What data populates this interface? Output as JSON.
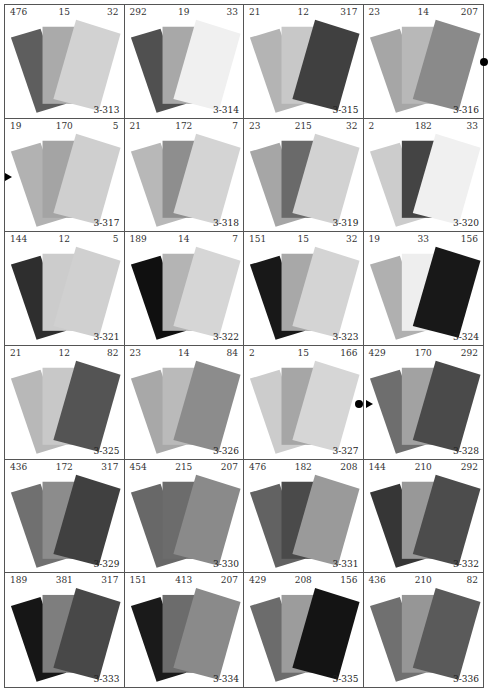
{
  "swatches": [
    {
      "id": "3-313",
      "nums": [
        "476",
        "15",
        "32"
      ],
      "colors": [
        "#5e5e5e",
        "#aaaaaa",
        "#d2d2d2"
      ]
    },
    {
      "id": "3-314",
      "nums": [
        "292",
        "19",
        "33"
      ],
      "colors": [
        "#505050",
        "#a8a8a8",
        "#f0f0f0"
      ]
    },
    {
      "id": "3-315",
      "nums": [
        "21",
        "12",
        "317"
      ],
      "colors": [
        "#b4b4b4",
        "#c8c8c8",
        "#404040"
      ]
    },
    {
      "id": "3-316",
      "nums": [
        "23",
        "14",
        "207"
      ],
      "colors": [
        "#a6a6a6",
        "#b8b8b8",
        "#8a8a8a"
      ]
    },
    {
      "id": "3-317",
      "nums": [
        "19",
        "170",
        "5"
      ],
      "colors": [
        "#b2b2b2",
        "#a4a4a4",
        "#cfcfcf"
      ]
    },
    {
      "id": "3-318",
      "nums": [
        "21",
        "172",
        "7"
      ],
      "colors": [
        "#b8b8b8",
        "#8e8e8e",
        "#d4d4d4"
      ]
    },
    {
      "id": "3-319",
      "nums": [
        "23",
        "215",
        "32"
      ],
      "colors": [
        "#a6a6a6",
        "#6a6a6a",
        "#d2d2d2"
      ]
    },
    {
      "id": "3-320",
      "nums": [
        "2",
        "182",
        "33"
      ],
      "colors": [
        "#cccccc",
        "#444444",
        "#f0f0f0"
      ]
    },
    {
      "id": "3-321",
      "nums": [
        "144",
        "12",
        "5"
      ],
      "colors": [
        "#2e2e2e",
        "#cccccc",
        "#d0d0d0"
      ]
    },
    {
      "id": "3-322",
      "nums": [
        "189",
        "14",
        "7"
      ],
      "colors": [
        "#101010",
        "#b4b4b4",
        "#d6d6d6"
      ]
    },
    {
      "id": "3-323",
      "nums": [
        "151",
        "15",
        "32"
      ],
      "colors": [
        "#181818",
        "#a8a8a8",
        "#d4d4d4"
      ]
    },
    {
      "id": "3-324",
      "nums": [
        "19",
        "33",
        "156"
      ],
      "colors": [
        "#b0b0b0",
        "#eeeeee",
        "#181818"
      ]
    },
    {
      "id": "3-325",
      "nums": [
        "21",
        "12",
        "82"
      ],
      "colors": [
        "#b8b8b8",
        "#c8c8c8",
        "#545454"
      ]
    },
    {
      "id": "3-326",
      "nums": [
        "23",
        "14",
        "84"
      ],
      "colors": [
        "#a8a8a8",
        "#bababa",
        "#8c8c8c"
      ]
    },
    {
      "id": "3-327",
      "nums": [
        "2",
        "15",
        "166"
      ],
      "colors": [
        "#cccccc",
        "#a6a6a6",
        "#d6d6d6"
      ]
    },
    {
      "id": "3-328",
      "nums": [
        "429",
        "170",
        "292"
      ],
      "colors": [
        "#6e6e6e",
        "#a2a2a2",
        "#4a4a4a"
      ]
    },
    {
      "id": "3-329",
      "nums": [
        "436",
        "172",
        "317"
      ],
      "colors": [
        "#707070",
        "#8c8c8c",
        "#404040"
      ]
    },
    {
      "id": "3-330",
      "nums": [
        "454",
        "215",
        "207"
      ],
      "colors": [
        "#686868",
        "#6c6c6c",
        "#8a8a8a"
      ]
    },
    {
      "id": "3-331",
      "nums": [
        "476",
        "182",
        "208"
      ],
      "colors": [
        "#626262",
        "#4a4a4a",
        "#9a9a9a"
      ]
    },
    {
      "id": "3-332",
      "nums": [
        "144",
        "210",
        "292"
      ],
      "colors": [
        "#363636",
        "#989898",
        "#4c4c4c"
      ]
    },
    {
      "id": "3-333",
      "nums": [
        "189",
        "381",
        "317"
      ],
      "colors": [
        "#161616",
        "#7e7e7e",
        "#484848"
      ]
    },
    {
      "id": "3-334",
      "nums": [
        "151",
        "413",
        "207"
      ],
      "colors": [
        "#1a1a1a",
        "#6c6c6c",
        "#8a8a8a"
      ]
    },
    {
      "id": "3-335",
      "nums": [
        "429",
        "208",
        "156"
      ],
      "colors": [
        "#6c6c6c",
        "#9c9c9c",
        "#141414"
      ]
    },
    {
      "id": "3-336",
      "nums": [
        "436",
        "210",
        "82"
      ],
      "colors": [
        "#707070",
        "#969696",
        "#5a5a5a"
      ]
    }
  ],
  "markers": [
    {
      "type": "dot",
      "left": 480,
      "top": 58
    },
    {
      "type": "tri",
      "left": 5,
      "top": 173
    },
    {
      "type": "dot",
      "left": 355,
      "top": 400
    },
    {
      "type": "tri",
      "left": 366,
      "top": 400
    }
  ]
}
